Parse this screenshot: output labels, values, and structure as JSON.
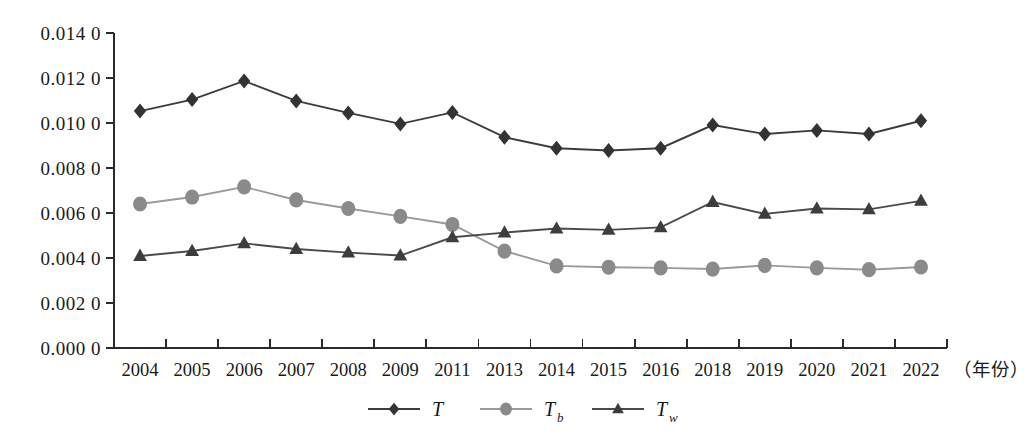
{
  "chart_data": {
    "type": "line",
    "title": "",
    "subtitle": "",
    "xlabel": "（年份）",
    "ylabel": "",
    "grid": false,
    "legend_position": "bottom-center",
    "categories": [
      "2004",
      "2005",
      "2006",
      "2007",
      "2008",
      "2009",
      "2011",
      "2013",
      "2014",
      "2015",
      "2016",
      "2018",
      "2019",
      "2020",
      "2021",
      "2022"
    ],
    "x": [
      2004,
      2005,
      2006,
      2007,
      2008,
      2009,
      2011,
      2013,
      2014,
      2015,
      2016,
      2018,
      2019,
      2020,
      2021,
      2022
    ],
    "ylim": [
      0.0,
      0.014
    ],
    "ytick_values": [
      0.0,
      0.002,
      0.004,
      0.006,
      0.008,
      0.01,
      0.012,
      0.014
    ],
    "ytick_labels": [
      "0.000 0",
      "0.002 0",
      "0.004 0",
      "0.006 0",
      "0.008 0",
      "0.010 0",
      "0.012 0",
      "0.014 0"
    ],
    "series": [
      {
        "name": "T",
        "marker": "diamond",
        "color": "#333333",
        "line_color": "#3c3c3c",
        "values": [
          0.01053,
          0.01104,
          0.01187,
          0.01098,
          0.01045,
          0.00996,
          0.01047,
          0.00937,
          0.00888,
          0.00878,
          0.00888,
          0.00991,
          0.00951,
          0.00967,
          0.00951,
          0.0101
        ]
      },
      {
        "name": "Tb",
        "marker": "circle",
        "color": "#8a8a8a",
        "line_color": "#9a9a9a",
        "values": [
          0.0064,
          0.00671,
          0.00716,
          0.00658,
          0.0062,
          0.00585,
          0.00549,
          0.00431,
          0.00365,
          0.00359,
          0.00356,
          0.00351,
          0.00367,
          0.00356,
          0.00348,
          0.0036
        ]
      },
      {
        "name": "Tw",
        "marker": "triangle",
        "color": "#3d3d3d",
        "line_color": "#4a4a4a",
        "values": [
          0.00409,
          0.00431,
          0.00465,
          0.0044,
          0.00424,
          0.00411,
          0.00492,
          0.00513,
          0.00531,
          0.00525,
          0.00536,
          0.00649,
          0.00596,
          0.0062,
          0.00616,
          0.00654
        ]
      }
    ],
    "legend": [
      {
        "label": "T",
        "sub": "",
        "marker": "diamond",
        "color": "#333333",
        "line_color": "#3c3c3c"
      },
      {
        "label": "T",
        "sub": "b",
        "marker": "circle",
        "color": "#8a8a8a",
        "line_color": "#9a9a9a"
      },
      {
        "label": "T",
        "sub": "w",
        "marker": "triangle",
        "color": "#3d3d3d",
        "line_color": "#4a4a4a"
      }
    ]
  },
  "axes": {
    "x_unit_label": "（年份）"
  },
  "colors": {
    "background": "#ffffff",
    "axis": "#2b2b2b",
    "text": "#1a1a1a",
    "series_T": "#333333",
    "series_Tb": "#8a8a8a",
    "series_Tw": "#3d3d3d"
  }
}
